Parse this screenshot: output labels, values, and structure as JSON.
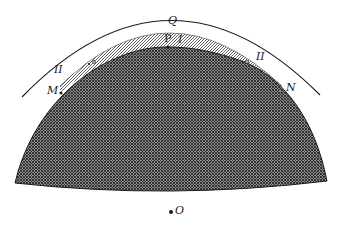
{
  "diagram": {
    "colors": {
      "ink": "#1a1a1a",
      "body_fill": "#5a5a5a",
      "band_fill": "#bdbdbd",
      "background": "#ffffff"
    },
    "labels": {
      "Q": "Q",
      "P": "P",
      "I": "I",
      "II_left": "II",
      "II_right": "II",
      "M": "M",
      "N": "N",
      "O": "O"
    },
    "regions": {
      "outer_arc": "outer circle arc",
      "hatched_band": "diagonally hatched layer",
      "dense_body": "cross-hatched body"
    }
  }
}
